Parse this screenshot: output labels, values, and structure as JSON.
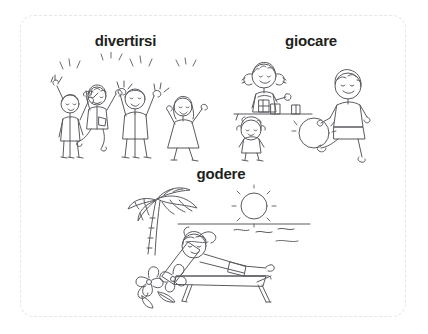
{
  "worksheet": {
    "border_color": "#e6e6e8",
    "background_color": "#ffffff",
    "ink_color": "#5a5a60",
    "label_color": "#221f20"
  },
  "cards": [
    {
      "id": "divertirsi",
      "label": "divertirsi",
      "illustration_name": "four-people-celebrating-illustration",
      "illustration_description": "Four people cheering with arms raised and confetti sparks"
    },
    {
      "id": "giocare",
      "label": "giocare",
      "illustration_name": "children-playing-illustration",
      "illustration_description": "A girl with pigtails stacking blocks at a table, a doll, and a boy kicking a ball"
    },
    {
      "id": "godere",
      "label": "godere",
      "illustration_name": "beach-relaxing-illustration",
      "illustration_description": "Person reclining on a lounge chair at the beach with palm tree, sun, sea and tropical flowers"
    }
  ]
}
